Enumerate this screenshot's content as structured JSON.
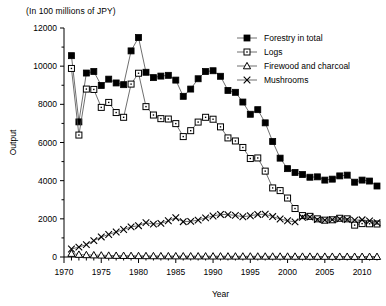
{
  "unit_note": "(In 100 millions of JPY)",
  "axes": {
    "ylabel": "Output",
    "xlabel": "Year",
    "y_ticks": [
      "0",
      "2000",
      "4000",
      "6000",
      "8000",
      "10000",
      "12000"
    ],
    "x_ticks": [
      "1970",
      "1975",
      "1980",
      "1985",
      "1990",
      "1995",
      "2000",
      "2005",
      "2010"
    ]
  },
  "legend": {
    "items": [
      {
        "label": "Forestry in total",
        "marker": "filled-square-marker"
      },
      {
        "label": "Logs",
        "marker": "open-square-marker"
      },
      {
        "label": "Firewood and charcoal",
        "marker": "open-triangle-marker"
      },
      {
        "label": "Mushrooms",
        "marker": "cross-marker"
      }
    ]
  },
  "chart_data": {
    "type": "line",
    "title": "",
    "subtitle": "(In 100 millions of JPY)",
    "xlabel": "Year",
    "ylabel": "Output",
    "xlim": [
      1970,
      2012
    ],
    "ylim": [
      0,
      12000
    ],
    "ytick_step": 2000,
    "xtick_major_step": 5,
    "xtick_minor_step": 1,
    "grid": false,
    "legend_position": "top-right",
    "x": [
      1971,
      1972,
      1973,
      1974,
      1975,
      1976,
      1977,
      1978,
      1979,
      1980,
      1981,
      1982,
      1983,
      1984,
      1985,
      1986,
      1987,
      1988,
      1989,
      1990,
      1991,
      1992,
      1993,
      1994,
      1995,
      1996,
      1997,
      1998,
      1999,
      2000,
      2001,
      2002,
      2003,
      2004,
      2005,
      2006,
      2007,
      2008,
      2009,
      2010,
      2011,
      2012
    ],
    "series": [
      {
        "name": "Forestry in total",
        "marker": "filled-square",
        "values": [
          10550,
          7080,
          9640,
          9720,
          8990,
          9320,
          9120,
          9030,
          10800,
          11500,
          9680,
          9400,
          9480,
          9520,
          9270,
          8420,
          8800,
          9340,
          9720,
          9760,
          9470,
          8730,
          8630,
          8120,
          7480,
          7720,
          7030,
          6050,
          5180,
          4630,
          4430,
          4320,
          4180,
          4200,
          4030,
          4080,
          4250,
          4290,
          3920,
          4030,
          3980,
          3720
        ]
      },
      {
        "name": "Logs",
        "marker": "open-square",
        "values": [
          9880,
          6390,
          8800,
          8780,
          7840,
          8100,
          7570,
          7320,
          9060,
          9630,
          7880,
          7440,
          7250,
          7230,
          6990,
          6310,
          6620,
          7070,
          7320,
          7220,
          6820,
          6240,
          6080,
          5740,
          5160,
          5190,
          4500,
          3620,
          3480,
          3090,
          2540,
          2170,
          2130,
          2000,
          1930,
          1950,
          2030,
          2000,
          1670,
          1750,
          1740,
          1730
        ]
      },
      {
        "name": "Firewood and charcoal",
        "marker": "open-triangle",
        "values": [
          180,
          130,
          110,
          100,
          90,
          80,
          75,
          70,
          65,
          60,
          58,
          55,
          52,
          50,
          48,
          46,
          45,
          44,
          42,
          41,
          40,
          38,
          37,
          36,
          35,
          34,
          33,
          32,
          31,
          30,
          29,
          28,
          27,
          26,
          25,
          24,
          23,
          22,
          21,
          20,
          19,
          18
        ]
      },
      {
        "name": "Mushrooms",
        "marker": "cross",
        "values": [
          420,
          520,
          650,
          860,
          1050,
          1180,
          1310,
          1440,
          1580,
          1640,
          1800,
          1720,
          1760,
          1900,
          2060,
          1850,
          1870,
          1930,
          2050,
          2150,
          2230,
          2220,
          2180,
          2110,
          2160,
          2230,
          2240,
          2120,
          1990,
          1900,
          1840,
          2080,
          2090,
          1960,
          1930,
          1960,
          1990,
          1960,
          1930,
          1950,
          1890,
          1800
        ]
      }
    ]
  }
}
